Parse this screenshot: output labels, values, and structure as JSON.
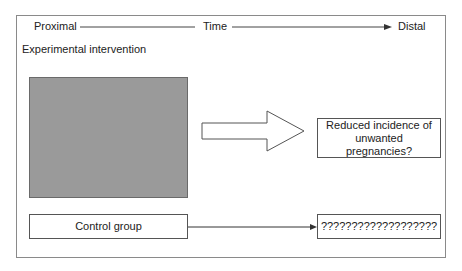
{
  "timeline": {
    "start_label": "Proximal",
    "middle_label": "Time",
    "end_label": "Distal"
  },
  "section_label": "Experimental intervention",
  "experimental": {
    "outcome_label": "Reduced incidence of unwanted pregnancies?"
  },
  "control": {
    "group_label": "Control group",
    "outcome_label": "???????????????????"
  },
  "colors": {
    "intervention_fill": "#9a9a9a",
    "border": "#555555"
  }
}
